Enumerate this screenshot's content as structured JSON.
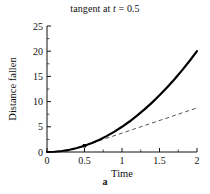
{
  "figure": {
    "title_prefix": "tangent at ",
    "title_var": "t",
    "title_suffix": " = 0.5",
    "caption": "a"
  },
  "chart_data": {
    "type": "line",
    "title": "tangent at t = 0.5",
    "xlabel": "Time",
    "ylabel": "Distance fallen",
    "xlim": [
      0,
      2
    ],
    "ylim": [
      0,
      25
    ],
    "xticks": [
      0,
      0.5,
      1,
      1.5,
      2
    ],
    "xtick_labels": [
      "0",
      "0.5",
      "1",
      "1.5",
      "2"
    ],
    "yticks": [
      0,
      5,
      10,
      15,
      20,
      25
    ],
    "ytick_labels": [
      "0",
      "5",
      "10",
      "15",
      "20",
      "25"
    ],
    "grid": false,
    "legend": false,
    "series": [
      {
        "name": "Distance fallen (5t^2)",
        "style": "solid",
        "color": "#000000",
        "width": 2.2,
        "x": [
          0,
          0.1,
          0.2,
          0.3,
          0.4,
          0.5,
          0.6,
          0.7,
          0.8,
          0.9,
          1.0,
          1.1,
          1.2,
          1.3,
          1.4,
          1.5,
          1.6,
          1.7,
          1.8,
          1.9,
          2.0
        ],
        "y": [
          0,
          0.05,
          0.2,
          0.45,
          0.8,
          1.25,
          1.8,
          2.45,
          3.2,
          4.05,
          5.0,
          6.05,
          7.2,
          8.45,
          9.8,
          11.25,
          12.8,
          14.45,
          16.2,
          18.05,
          20.0
        ]
      },
      {
        "name": "tangent at t = 0.5 (5t - 1.25)",
        "style": "dashed",
        "color": "#555555",
        "width": 1,
        "x": [
          0.25,
          2.0
        ],
        "y": [
          0,
          8.75
        ]
      }
    ],
    "markers": [
      {
        "name": "tangent-point",
        "x": 0.5,
        "y": 1.25,
        "shape": "square",
        "color": "#000000"
      }
    ]
  },
  "axis_labels": {
    "x_title": "Time",
    "y_title": "Distance fallen"
  }
}
